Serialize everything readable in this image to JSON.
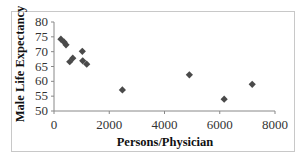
{
  "chart_data": {
    "type": "scatter",
    "title": "",
    "xlabel": "Persons/Physician",
    "ylabel": "Male Life Expectancy",
    "xlim": [
      0,
      8000
    ],
    "ylim": [
      50,
      80
    ],
    "x_ticks": [
      0,
      2000,
      4000,
      6000,
      8000
    ],
    "y_ticks": [
      50,
      55,
      60,
      65,
      70,
      75,
      80
    ],
    "grid": false,
    "legend": null,
    "marker": "diamond",
    "marker_color": "#4a4a4a",
    "series": [
      {
        "name": "Countries",
        "points": [
          {
            "x": 250,
            "y": 74.2
          },
          {
            "x": 370,
            "y": 73.2
          },
          {
            "x": 435,
            "y": 72.3
          },
          {
            "x": 570,
            "y": 66.6
          },
          {
            "x": 680,
            "y": 67.8
          },
          {
            "x": 1025,
            "y": 70.1
          },
          {
            "x": 1040,
            "y": 66.9
          },
          {
            "x": 1185,
            "y": 65.8
          },
          {
            "x": 2475,
            "y": 57.1
          },
          {
            "x": 4900,
            "y": 62.2
          },
          {
            "x": 6160,
            "y": 54.0
          },
          {
            "x": 7175,
            "y": 59.0
          }
        ]
      }
    ]
  }
}
